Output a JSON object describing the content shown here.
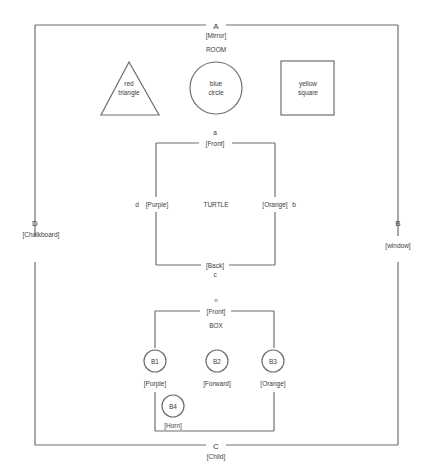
{
  "room": {
    "title": "ROOM",
    "walls": {
      "top": {
        "letter": "A",
        "label": "[Mirror]"
      },
      "right": {
        "letter": "B",
        "label": "[window]"
      },
      "bottom": {
        "letter": "C",
        "label": "[Child]"
      },
      "left": {
        "letter": "D",
        "label": "[Chalkboard]"
      }
    },
    "objects": [
      {
        "shape": "triangle",
        "line1": "red",
        "line2": "triangle"
      },
      {
        "shape": "circle",
        "line1": "blue",
        "line2": "circle"
      },
      {
        "shape": "square",
        "line1": "yellow",
        "line2": "square"
      }
    ]
  },
  "turtle": {
    "title": "TURTLE",
    "sides": {
      "top": {
        "letter": "a",
        "label": "[Front]"
      },
      "right": {
        "letter": "b",
        "label": "[Orange]"
      },
      "bottom": {
        "letter": "c",
        "label": "[Back]"
      },
      "left": {
        "letter": "d",
        "label": "[Purple]"
      }
    }
  },
  "box": {
    "title": "BOX",
    "top": {
      "letter": "n",
      "label": "[Front]"
    },
    "buttons": [
      {
        "id": "B1",
        "label": "[Purple]"
      },
      {
        "id": "B2",
        "label": "[Forward]"
      },
      {
        "id": "B3",
        "label": "[Orange]"
      },
      {
        "id": "B4",
        "label": "[Horn]"
      }
    ]
  }
}
